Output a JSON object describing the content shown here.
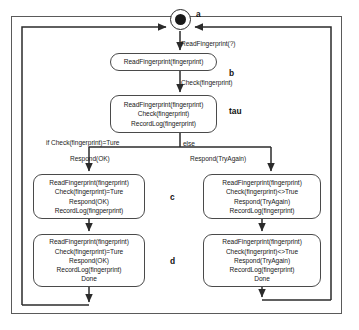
{
  "diagram": {
    "stroke_color": "#4a4a4a",
    "text_color": "#202020",
    "frame_color": "#5a5a5a",
    "initial_node": {
      "name": "initial-state-node",
      "annotation": "a"
    },
    "annotations": {
      "a": "a",
      "b": "b",
      "tau": "tau",
      "c": "c",
      "d": "d"
    },
    "edge_labels": {
      "read_fingerprint_query": "ReadFingerprint(?)",
      "check_fingerprint": "Check(fingerprint)",
      "guard_if": "if Check(fingerprint)=Ture",
      "guard_else": "else",
      "respond_ok": "Respond(OK)",
      "respond_tryagain": "Respond(TryAgain)"
    },
    "nodes": {
      "read": {
        "id": "state-read",
        "lines": [
          "ReadFingerprint(fingerprint)"
        ]
      },
      "tau": {
        "id": "state-tau",
        "lines": [
          "ReadFingerprint(fingerprint)",
          "Check(fingerprint)",
          "RecordLog(fingerprint)"
        ]
      },
      "c_left": {
        "id": "state-c-ok",
        "lines": [
          "ReadFingerprint(fingerprint)",
          "Check(fingerprint)=Ture",
          "Respond(OK)",
          "RecordLog(fingperprint)"
        ]
      },
      "c_right": {
        "id": "state-c-tryagain",
        "lines": [
          "ReadFingerprint(fingerprint)",
          "Check(fingerprint)<>True",
          "Respond(TryAgain)",
          "RecordLog(fingerprint)"
        ]
      },
      "d_left": {
        "id": "state-d-ok-done",
        "lines": [
          "ReadFingerprint(fingerprint)",
          "Check(fingerprint)=Ture",
          "Respond(OK)",
          "RecordLog(fingerprint)",
          "Done"
        ]
      },
      "d_right": {
        "id": "state-d-tryagain-done",
        "lines": [
          "ReadFingerprint(fingerprint)",
          "Check(fingerprint)<>True",
          "Respond(TryAgain)",
          "RecordLog(fingerprint)",
          "Done"
        ]
      }
    }
  }
}
